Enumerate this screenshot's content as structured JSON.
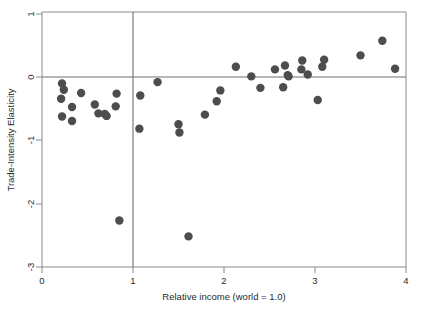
{
  "figure": {
    "background_color": "#ffffff",
    "point_color": "#4d4d4d",
    "axis_color": "#8a8a8a",
    "reference_line_color": "#6e6e6e"
  },
  "axes": {
    "x_title": "Relative income (world = 1.0)",
    "y_title": "Trade-Intensity Elasticity",
    "x_ticks": [
      "0",
      "1",
      "2",
      "3",
      "4"
    ],
    "y_ticks": [
      "1",
      "0",
      "-1",
      "-2",
      "-3"
    ]
  },
  "chart_data": {
    "type": "scatter",
    "title": "",
    "xlabel": "Relative income (world = 1.0)",
    "ylabel": "Trade-Intensity Elasticity",
    "xlim": [
      0,
      4
    ],
    "ylim": [
      -3,
      1
    ],
    "xticks": [
      0,
      1,
      2,
      3,
      4
    ],
    "yticks": [
      -3,
      -2,
      -1,
      0,
      1
    ],
    "grid": false,
    "legend": "none",
    "reference_lines": [
      {
        "orientation": "horizontal",
        "value": 0
      },
      {
        "orientation": "vertical",
        "value": 1.0
      }
    ],
    "marker": {
      "shape": "circle",
      "size": 4.2,
      "color": "#4d4d4d"
    },
    "points": [
      {
        "x": 0.22,
        "y": -0.12
      },
      {
        "x": 0.24,
        "y": -0.22
      },
      {
        "x": 0.21,
        "y": -0.36
      },
      {
        "x": 0.22,
        "y": -0.64
      },
      {
        "x": 0.33,
        "y": -0.49
      },
      {
        "x": 0.33,
        "y": -0.71
      },
      {
        "x": 0.43,
        "y": -0.27
      },
      {
        "x": 0.58,
        "y": -0.45
      },
      {
        "x": 0.62,
        "y": -0.59
      },
      {
        "x": 0.69,
        "y": -0.6
      },
      {
        "x": 0.71,
        "y": -0.63
      },
      {
        "x": 0.82,
        "y": -0.28
      },
      {
        "x": 0.81,
        "y": -0.48
      },
      {
        "x": 0.85,
        "y": -2.27
      },
      {
        "x": 1.08,
        "y": -0.31
      },
      {
        "x": 1.07,
        "y": -0.83
      },
      {
        "x": 1.27,
        "y": -0.1
      },
      {
        "x": 1.5,
        "y": -0.76
      },
      {
        "x": 1.51,
        "y": -0.89
      },
      {
        "x": 1.61,
        "y": -2.52
      },
      {
        "x": 1.79,
        "y": -0.61
      },
      {
        "x": 1.92,
        "y": -0.4
      },
      {
        "x": 1.96,
        "y": -0.23
      },
      {
        "x": 2.13,
        "y": 0.14
      },
      {
        "x": 2.3,
        "y": -0.01
      },
      {
        "x": 2.4,
        "y": -0.19
      },
      {
        "x": 2.56,
        "y": 0.1
      },
      {
        "x": 2.65,
        "y": -0.18
      },
      {
        "x": 2.67,
        "y": 0.16
      },
      {
        "x": 2.7,
        "y": 0.01
      },
      {
        "x": 2.71,
        "y": -0.01
      },
      {
        "x": 2.85,
        "y": 0.1
      },
      {
        "x": 2.86,
        "y": 0.24
      },
      {
        "x": 2.92,
        "y": 0.02
      },
      {
        "x": 3.03,
        "y": -0.38
      },
      {
        "x": 3.08,
        "y": 0.14
      },
      {
        "x": 3.1,
        "y": 0.25
      },
      {
        "x": 3.5,
        "y": 0.32
      },
      {
        "x": 3.74,
        "y": 0.55
      },
      {
        "x": 3.88,
        "y": 0.11
      }
    ]
  }
}
